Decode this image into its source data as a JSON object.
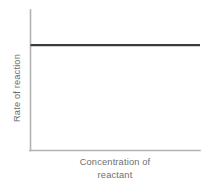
{
  "figure": {
    "background": "#ffffff",
    "width": 209,
    "height": 187
  },
  "chart_data": {
    "type": "line",
    "title": "",
    "subtitle": "",
    "xlabel": "Concentration of reactant",
    "xlabel_line1": "Concentration of",
    "xlabel_line2": "reactant",
    "ylabel": "Rate of reaction",
    "grid": false,
    "legend": false,
    "legend_position": "none",
    "xlim": [
      0,
      1
    ],
    "ylim": [
      0,
      1
    ],
    "xticks": [],
    "yticks": [],
    "xtick_labels": [],
    "ytick_labels": [],
    "axis_color": "#b3b3b3",
    "label_color": "#6e6e6e",
    "series": [
      {
        "name": "Rate of reaction",
        "color": "#3c3c3c",
        "x": [
          0.0,
          0.25,
          0.5,
          0.75,
          1.0
        ],
        "values": [
          0.75,
          0.75,
          0.75,
          0.75,
          0.75
        ],
        "description": "Rate is constant and independent of reactant concentration (zero order)"
      }
    ],
    "annotations": []
  }
}
